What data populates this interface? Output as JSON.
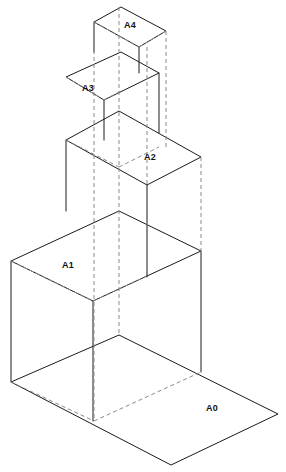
{
  "figure": {
    "type": "isometric-technical-diagram",
    "background_color": "#ffffff",
    "solid_line_color": "#1a1a1a",
    "hidden_line_color": "#8a8a8a",
    "label_color": "#111111",
    "canvas": {
      "width": 286,
      "height": 472
    }
  },
  "sheets": [
    {
      "id": "A0",
      "label": "A0",
      "label_x": 212,
      "label_y": 411,
      "face": "11,382 119,335 278,414 171,465",
      "vertices": {
        "left": {
          "x": 11,
          "y": 382
        },
        "top": {
          "x": 119,
          "y": 335
        },
        "right": {
          "x": 278,
          "y": 414
        },
        "bottom": {
          "x": 171,
          "y": 465
        }
      },
      "hidden_edges": [
        "11,382 94,421",
        "94,421 201,372"
      ]
    },
    {
      "id": "A1",
      "label": "A1",
      "label_x": 68,
      "label_y": 268,
      "face": "11,261 119,211 201,251 93,301",
      "vertices": {
        "left": {
          "x": 11,
          "y": 261
        },
        "top": {
          "x": 119,
          "y": 211
        },
        "right": {
          "x": 201,
          "y": 251
        },
        "bottom": {
          "x": 93,
          "y": 301
        }
      },
      "hidden_edges": [
        "11,261 93,301",
        "93,301 147,276"
      ]
    },
    {
      "id": "A2",
      "label": "A2",
      "label_x": 150,
      "label_y": 160,
      "face": "66,140 119,111 201,157 147,185",
      "vertices": {
        "left": {
          "x": 66,
          "y": 140
        },
        "top": {
          "x": 119,
          "y": 111
        },
        "right": {
          "x": 201,
          "y": 157
        },
        "bottom": {
          "x": 147,
          "y": 185
        }
      },
      "hidden_edges": [
        "66,140 119,167",
        "119,167 159,147"
      ]
    },
    {
      "id": "A3",
      "label": "A3",
      "label_x": 88,
      "label_y": 91,
      "face": "66,77 121,52 159,73 104,100",
      "vertices": {
        "left": {
          "x": 66,
          "y": 77
        },
        "top": {
          "x": 121,
          "y": 52
        },
        "right": {
          "x": 159,
          "y": 73
        },
        "bottom": {
          "x": 104,
          "y": 100
        }
      },
      "hidden_edges": [
        "66,77 104,100",
        "104,100 121,91"
      ]
    },
    {
      "id": "A4",
      "label": "A4",
      "label_x": 130,
      "label_y": 28,
      "face": "94,22 121,7 166,31 139,47",
      "vertices": {
        "left": {
          "x": 94,
          "y": 22
        },
        "top": {
          "x": 121,
          "y": 7
        },
        "right": {
          "x": 166,
          "y": 31
        },
        "bottom": {
          "x": 139,
          "y": 47
        }
      },
      "hidden_edges": [
        "94,22 139,47",
        "139,47 166,31"
      ]
    }
  ],
  "connecting_faces": [
    {
      "id": "A1-front-left",
      "path": "11,261 11,382 93,421 93,301"
    },
    {
      "id": "A1-front-right",
      "path": "93,301 201,251 201,372 93,421"
    },
    {
      "id": "A2-front-right",
      "path": "147,185 201,157 201,251 147,277"
    },
    {
      "id": "A2-front-left",
      "path": "66,140 66,... "
    }
  ],
  "solid_connectors": [
    {
      "id": "a1-left-vertical",
      "path": "11,261 11,382"
    },
    {
      "id": "a1-bottom-vertical",
      "path": "93,301 93,421"
    },
    {
      "id": "a1-right-vertical",
      "path": "201,251 201,372"
    },
    {
      "id": "a2-bottom-vertical",
      "path": "147,185 147,277"
    },
    {
      "id": "a2-left-vertical",
      "path": "66,140 66,211"
    },
    {
      "id": "a3-bottom-vertical",
      "path": "104,100 104,140"
    },
    {
      "id": "a3-right-vertical",
      "path": "159,73 159,133"
    },
    {
      "id": "a4-bottom-vertical",
      "path": "139,47 139,73"
    },
    {
      "id": "a4-left-vertical",
      "path": "94,22 94,52"
    }
  ],
  "projection_lines": [
    {
      "id": "proj-far-left",
      "path": "11,261 11,382"
    },
    {
      "id": "proj-center-left",
      "path": "94,22 94,421"
    },
    {
      "id": "proj-center",
      "path": "119,7 119,335"
    },
    {
      "id": "proj-center-right",
      "path": "147,47 147,277"
    },
    {
      "id": "proj-right",
      "path": "166,31 166,147"
    },
    {
      "id": "proj-far-right",
      "path": "201,157 201,372"
    }
  ],
  "labels_summary": [
    "A0",
    "A1",
    "A2",
    "A3",
    "A4"
  ]
}
